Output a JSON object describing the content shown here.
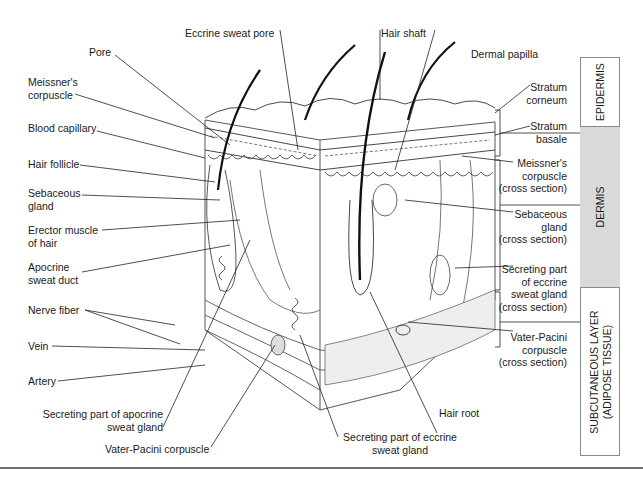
{
  "diagram": {
    "left_labels": [
      {
        "id": "pore",
        "text": "Pore"
      },
      {
        "id": "meissners-corpuscle",
        "text": "Meissner's\ncorpuscle"
      },
      {
        "id": "blood-capillary",
        "text": "Blood capillary"
      },
      {
        "id": "hair-follicle",
        "text": "Hair follicle"
      },
      {
        "id": "sebaceous-gland",
        "text": "Sebaceous\ngland"
      },
      {
        "id": "erector-muscle",
        "text": "Erector muscle\nof hair"
      },
      {
        "id": "apocrine-sweat-duct",
        "text": "Apocrine\nsweat duct"
      },
      {
        "id": "nerve-fiber",
        "text": "Nerve fiber"
      },
      {
        "id": "vein",
        "text": "Vein"
      },
      {
        "id": "artery",
        "text": "Artery"
      }
    ],
    "top_labels": [
      {
        "id": "eccrine-sweat-pore",
        "text": "Eccrine sweat pore"
      },
      {
        "id": "hair-shaft",
        "text": "Hair shaft"
      },
      {
        "id": "dermal-papilla",
        "text": "Dermal papilla"
      }
    ],
    "bottom_labels": [
      {
        "id": "secreting-apocrine",
        "text": "Secreting part of apocrine\nsweat gland"
      },
      {
        "id": "vater-pacini",
        "text": "Vater-Pacini corpuscle"
      },
      {
        "id": "secreting-eccrine",
        "text": "Secreting part of eccrine\nsweat gland"
      },
      {
        "id": "hair-root",
        "text": "Hair root"
      }
    ],
    "right_labels": [
      {
        "id": "stratum-corneum",
        "text": "Stratum\ncorneum"
      },
      {
        "id": "stratum-basale",
        "text": "Stratum\nbasale"
      },
      {
        "id": "meissners-cross",
        "text": "Meissner's\ncorpuscle\n(cross section)"
      },
      {
        "id": "sebaceous-cross",
        "text": "Sebaceous\ngland\n(cross section)"
      },
      {
        "id": "eccrine-cross",
        "text": "Secreting part\nof eccrine\nsweat gland\n(cross section)"
      },
      {
        "id": "vater-pacini-cross",
        "text": "Vater-Pacini\ncorpuscle\n(cross section)"
      }
    ],
    "layers": [
      {
        "id": "epidermis",
        "text": "EPIDERMIS",
        "fill": "#ffffff"
      },
      {
        "id": "dermis",
        "text": "DERMIS",
        "fill": "#d9d9d9"
      },
      {
        "id": "subcutaneous",
        "text": "SUBCUTANEOUS LAYER\n(ADIPOSE TISSUE)",
        "fill": "#ffffff"
      }
    ]
  }
}
